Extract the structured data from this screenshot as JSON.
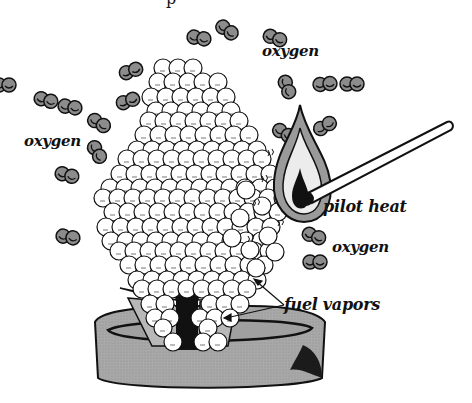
{
  "diagram": {
    "title_fragment": "p",
    "labels": [
      {
        "id": "oxygen-top-right",
        "text": "oxygen",
        "x": 262,
        "y": 44,
        "size": 15
      },
      {
        "id": "oxygen-left",
        "text": "oxygen",
        "x": 24,
        "y": 134,
        "size": 15
      },
      {
        "id": "pilot-heat",
        "text": "pilot heat",
        "x": 323,
        "y": 199,
        "size": 16
      },
      {
        "id": "oxygen-bottom-right",
        "text": "oxygen",
        "x": 332,
        "y": 240,
        "size": 15
      },
      {
        "id": "fuel-vapors",
        "text": "fuel vapors",
        "x": 284,
        "y": 297,
        "size": 16
      }
    ],
    "oxygen_molecules": [
      {
        "x": 199,
        "y": 38,
        "r": 7,
        "angle": 10
      },
      {
        "x": 227,
        "y": 30,
        "r": 7,
        "angle": 35
      },
      {
        "x": 131,
        "y": 71,
        "r": 7,
        "angle": -20
      },
      {
        "x": 128,
        "y": 101,
        "r": 7,
        "angle": -20
      },
      {
        "x": 70,
        "y": 107,
        "r": 7,
        "angle": 10
      },
      {
        "x": 99,
        "y": 123,
        "r": 7,
        "angle": 30
      },
      {
        "x": 97,
        "y": 152,
        "r": 7,
        "angle": 60
      },
      {
        "x": 67,
        "y": 175,
        "r": 7,
        "angle": 15
      },
      {
        "x": 68,
        "y": 237,
        "r": 7,
        "angle": 10
      },
      {
        "x": 46,
        "y": 100,
        "r": 7,
        "angle": 15
      },
      {
        "x": 4,
        "y": 85,
        "r": 7,
        "angle": 0
      },
      {
        "x": 287,
        "y": 87,
        "r": 7,
        "angle": 70
      },
      {
        "x": 325,
        "y": 84,
        "r": 7,
        "angle": -5
      },
      {
        "x": 325,
        "y": 126,
        "r": 7,
        "angle": -30
      },
      {
        "x": 284,
        "y": 133,
        "r": 7,
        "angle": 30
      },
      {
        "x": 352,
        "y": 84,
        "r": 7,
        "angle": 0
      },
      {
        "x": 314,
        "y": 236,
        "r": 7,
        "angle": 20
      },
      {
        "x": 315,
        "y": 262,
        "r": 7,
        "angle": 0
      },
      {
        "x": 275,
        "y": 38,
        "r": 7,
        "angle": 20
      }
    ],
    "match": {
      "x1": 310,
      "y1": 195,
      "x2": 451,
      "y2": 126
    },
    "flame": {
      "cx": 300,
      "cy": 175
    },
    "colors": {
      "ink": "#111111",
      "oxygen_fill": "#8c8c8c",
      "flame_outer": "#9a9a9a",
      "flame_inner": "#e8e8e8",
      "pot_fill": "#a8a8a8",
      "pot_dark": "#222222",
      "vapor_fill": "#ffffff",
      "wick_fill": "#111111",
      "wick_side": "#b0b0b0"
    }
  }
}
